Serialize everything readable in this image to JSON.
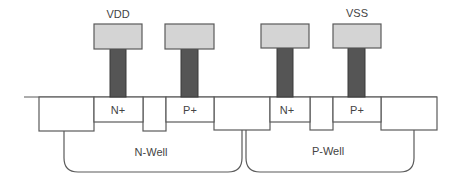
{
  "diagram": {
    "type": "cmos-cross-section",
    "colors": {
      "background": "#ffffff",
      "outline": "#5a5a5a",
      "pad_fill": "#d4d4d4",
      "via_fill": "#555555",
      "text": "#444444"
    },
    "labels": {
      "vdd": "VDD",
      "vss": "VSS",
      "n_plus_left": "N+",
      "p_plus_left": "P+",
      "n_plus_right": "N+",
      "p_plus_right": "P+",
      "n_well": "N-Well",
      "p_well": "P-Well"
    },
    "pads": [
      {
        "name": "pad-1",
        "x": 94,
        "y": 24,
        "w": 48,
        "h": 25
      },
      {
        "name": "pad-2",
        "x": 165,
        "y": 24,
        "w": 49,
        "h": 25
      },
      {
        "name": "pad-3",
        "x": 261,
        "y": 24,
        "w": 48,
        "h": 24
      },
      {
        "name": "pad-4",
        "x": 333,
        "y": 24,
        "w": 48,
        "h": 24
      }
    ],
    "vias": [
      {
        "name": "via-1",
        "x": 110,
        "y": 49,
        "w": 16,
        "h": 48
      },
      {
        "name": "via-2",
        "x": 181,
        "y": 49,
        "w": 17,
        "h": 48
      },
      {
        "name": "via-3",
        "x": 277,
        "y": 48,
        "w": 16,
        "h": 49
      },
      {
        "name": "via-4",
        "x": 348,
        "y": 48,
        "w": 17,
        "h": 49
      }
    ]
  }
}
